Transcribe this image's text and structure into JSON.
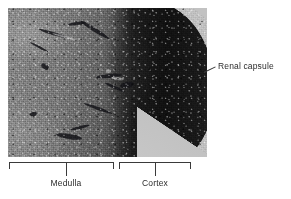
{
  "figure": {
    "name": "kidney-histology-micrograph",
    "background_color": "#ffffff",
    "image": {
      "name": "renal-section-lightmicrograph",
      "description": "Light micrograph of a sectioned kidney showing medulla, cortex and renal capsule",
      "slide_background_color": "#c2c2c2",
      "medulla_tone": "#7b7b7b",
      "cortex_tone": "#141414"
    }
  },
  "annotations": {
    "renal_capsule": {
      "label": "Renal capsule",
      "leader": "diagonal-leader-line",
      "color": "#2b2b2b"
    },
    "medulla": {
      "label": "Medulla",
      "bracket": "bottom-bracket",
      "color": "#2b2b2b"
    },
    "cortex": {
      "label": "Cortex",
      "bracket": "bottom-bracket",
      "color": "#2b2b2b"
    }
  }
}
